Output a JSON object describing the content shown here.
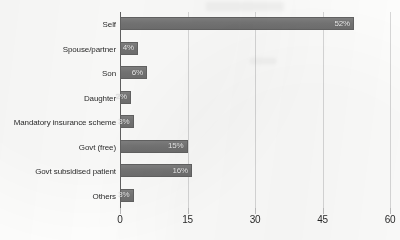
{
  "chart_data": {
    "type": "bar",
    "orientation": "horizontal",
    "title": "",
    "xlabel": "",
    "ylabel": "",
    "categories": [
      "Self",
      "Spouse/partner",
      "Son",
      "Daughter",
      "Mandatory insurance scheme",
      "Govt (free)",
      "Govt subsidised patient",
      "Others"
    ],
    "values": [
      52,
      4,
      6,
      2,
      3,
      15,
      16,
      3
    ],
    "value_labels": [
      "52%",
      "4%",
      "6%",
      "2%",
      "3%",
      "15%",
      "16%",
      "3%"
    ],
    "xticks": [
      0,
      15,
      30,
      45,
      60
    ],
    "xtick_labels": [
      "0",
      "15",
      "30",
      "45",
      "60"
    ],
    "xlim": [
      0,
      60
    ],
    "grid": "vertical",
    "legend": "none",
    "bar_color": "#757575",
    "value_label_color": "#f2f2f2",
    "gridline_color": "#d9d9d9",
    "axis_color": "#5b5b5b",
    "background_color": "#fdfdfc"
  }
}
